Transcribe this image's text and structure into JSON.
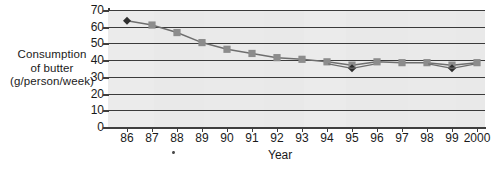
{
  "chart_data": {
    "type": "line",
    "title": "",
    "xlabel": "Year",
    "ylabel": "Consumption of butter (g/person/week)",
    "ylabel_lines": [
      "Consumption",
      "of butter",
      "(g/person/week)"
    ],
    "categories": [
      "86",
      "87",
      "88",
      "89",
      "90",
      "91",
      "92",
      "93",
      "94",
      "95",
      "96",
      "97",
      "98",
      "99",
      "2000"
    ],
    "xtick_labels": [
      "86",
      "87",
      "88",
      "89",
      "90",
      "91",
      "92",
      "93",
      "94",
      "95",
      "96",
      "97",
      "98",
      "99",
      "2000"
    ],
    "ytick_labels": [
      "0",
      "10",
      "20",
      "30",
      "40",
      "50",
      "60",
      "70"
    ],
    "yticks": [
      0,
      10,
      20,
      30,
      40,
      50,
      60,
      70
    ],
    "ylim": [
      0,
      70
    ],
    "xlim": [
      1985.5,
      2000.5
    ],
    "grid": "horizontal",
    "legend": "none",
    "series": [
      {
        "name": "Consumption of butter",
        "marker": "square",
        "marker_color": "#8c8c8c",
        "line_color": "#6e6e6e",
        "values": [
          63.5,
          61.0,
          56.5,
          50.5,
          46.5,
          44.0,
          41.5,
          40.5,
          39.0,
          37.0,
          39.0,
          38.5,
          38.5,
          37.0,
          38.5
        ]
      }
    ],
    "highlight_points": [
      {
        "category": "86",
        "value": 63.5,
        "marker": "diamond",
        "color": "#2e2e2e"
      },
      {
        "category": "95",
        "value": 37.0,
        "marker": "diamond",
        "color": "#2e2e2e"
      },
      {
        "category": "99",
        "value": 37.0,
        "marker": "diamond",
        "color": "#2e2e2e"
      }
    ],
    "colors": {
      "plot_background": "#e9e9e9",
      "gridline": "#3a3a3a",
      "axis": "#3f3f3f",
      "text": "#1a1a1a",
      "series_marker": "#8c8c8c",
      "series_line": "#6e6e6e",
      "highlight_marker": "#2e2e2e"
    }
  },
  "axis": {
    "y_title_line1": "Consumption",
    "y_title_line2": "of butter",
    "y_title_line3": "(g/person/week)",
    "x_title": "Year"
  }
}
